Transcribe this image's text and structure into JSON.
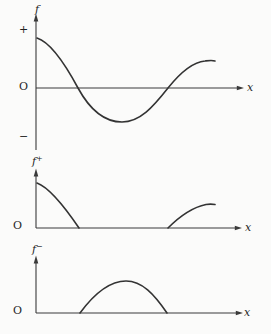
{
  "figure": {
    "background": "#fbfbfa",
    "line_color": "#333333",
    "text_color": "#1f1f1f"
  },
  "panels": [
    {
      "id": "f",
      "y_label_base": "f",
      "y_label_sup": "",
      "plus_label": "+",
      "origin_label": "O",
      "minus_label": "−",
      "x_label": "x",
      "geom": {
        "y_axis": "M36,19 L36,150",
        "y_arrow": "M36,13.5 L33.7,21.5 L38.3,21.5 Z",
        "x_axis": "M36,88 L238,88",
        "x_arrow": "M244,88 L236.8,85.8 L236.8,90.2 Z",
        "curve": "M37,38 C50,42 64,62 78,88 C90,110 104,122 122,122 C140,122 153,107 168,88 C180,73 193,62 205,61 C209,60.5 212,60 215,61"
      }
    },
    {
      "id": "f-plus",
      "y_label_base": "f",
      "y_label_sup": "+",
      "plus_label": "",
      "origin_label": "O",
      "minus_label": "",
      "x_label": "x",
      "geom": {
        "y_axis": "M36,174 L36,228",
        "y_arrow": "M36,168.5 L33.7,176.5 L38.3,176.5 Z",
        "x_axis": "M36,228 L236,228",
        "x_arrow": "M242,228 L234.8,225.8 L234.8,230.2 Z",
        "curve": "M37,183 C48,187 62,203 79,228 M168,228 C180,216 194,207 206,204.5 C209,204 212,204 215,204.5"
      }
    },
    {
      "id": "f-minus",
      "y_label_base": "f",
      "y_label_sup": "−",
      "plus_label": "",
      "origin_label": "O",
      "minus_label": "",
      "x_label": "x",
      "geom": {
        "y_axis": "M36,261 L36,313",
        "y_arrow": "M36,255.5 L33.7,263.5 L38.3,263.5 Z",
        "x_axis": "M36,313 L237,313",
        "x_arrow": "M243,313 L235.8,310.8 L235.8,315.2 Z",
        "curve": "M80,313 C94,294 110,281 126,281 C142,281 154,294 167,313"
      }
    }
  ],
  "chart_data": {
    "type": "line",
    "x": [
      0,
      0.5,
      1,
      1.5,
      2,
      2.5,
      3,
      3.5,
      4.15,
      5,
      5.5,
      6.4,
      7,
      7.5,
      8,
      8.6
    ],
    "series": [
      {
        "name": "f",
        "values": [
          1.7,
          1.55,
          1.2,
          0.7,
          0,
          -0.55,
          -0.9,
          -1.1,
          -1.17,
          -1.05,
          -0.8,
          0,
          0.45,
          0.7,
          0.87,
          0.93
        ]
      },
      {
        "name": "f+",
        "values": [
          1.7,
          1.55,
          1.2,
          0.7,
          0,
          0,
          0,
          0,
          0,
          0,
          0,
          0,
          0.45,
          0.7,
          0.87,
          0.93
        ]
      },
      {
        "name": "f-",
        "values": [
          0,
          0,
          0,
          0,
          0,
          0.55,
          0.9,
          1.1,
          1.17,
          1.05,
          0.8,
          0,
          0,
          0,
          0,
          0
        ]
      }
    ],
    "xlabel": "x",
    "ylabel": "f",
    "axis_ranges": {
      "x": [
        0,
        10
      ],
      "y_top_panel": [
        -2,
        2.3
      ]
    },
    "zero_crossings_x": [
      2,
      6.4
    ],
    "minimum": {
      "x": 4.15,
      "f": -1.17
    },
    "grid": false,
    "legend": "none",
    "panels": [
      "f",
      "f+",
      "f-"
    ],
    "panel_count": 3
  }
}
